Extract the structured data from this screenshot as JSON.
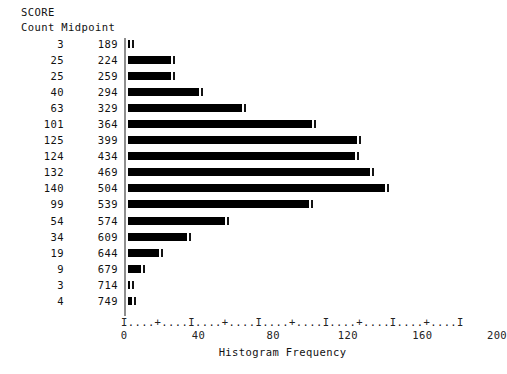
{
  "figure": {
    "title": "SCORE",
    "count_header": "Count",
    "midpoint_header": "Midpoint",
    "x_axis_title": "Histogram Frequency",
    "axis_ruler": "I....+....I....+....I....+....I....+....I....+....I",
    "bar_color": "#000000",
    "axis_color": "#8e8e8e",
    "text_color": "#111111"
  },
  "chart_data": {
    "type": "bar",
    "orientation": "horizontal",
    "title": "SCORE",
    "xlabel": "Histogram Frequency",
    "ylabel": "Midpoint",
    "xlim": [
      0,
      200
    ],
    "xticks": [
      0,
      40,
      80,
      120,
      160,
      200
    ],
    "grid": false,
    "legend": false,
    "categories": [
      189,
      224,
      259,
      294,
      329,
      364,
      399,
      434,
      469,
      504,
      539,
      574,
      609,
      644,
      679,
      714,
      749
    ],
    "values": [
      3,
      25,
      25,
      40,
      63,
      101,
      125,
      124,
      132,
      140,
      99,
      54,
      34,
      19,
      9,
      3,
      4
    ],
    "rows": [
      {
        "count": 3,
        "midpoint": 189
      },
      {
        "count": 25,
        "midpoint": 224
      },
      {
        "count": 25,
        "midpoint": 259
      },
      {
        "count": 40,
        "midpoint": 294
      },
      {
        "count": 63,
        "midpoint": 329
      },
      {
        "count": 101,
        "midpoint": 364
      },
      {
        "count": 125,
        "midpoint": 399
      },
      {
        "count": 124,
        "midpoint": 434
      },
      {
        "count": 132,
        "midpoint": 469
      },
      {
        "count": 140,
        "midpoint": 504
      },
      {
        "count": 99,
        "midpoint": 539
      },
      {
        "count": 54,
        "midpoint": 574
      },
      {
        "count": 34,
        "midpoint": 609
      },
      {
        "count": 19,
        "midpoint": 644
      },
      {
        "count": 9,
        "midpoint": 679
      },
      {
        "count": 3,
        "midpoint": 714
      },
      {
        "count": 4,
        "midpoint": 749
      }
    ]
  }
}
